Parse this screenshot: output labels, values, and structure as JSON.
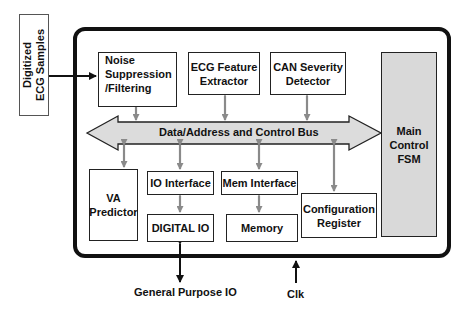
{
  "diagram": {
    "type": "block-diagram",
    "input": {
      "label_line1": "Digitized",
      "label_line2": "ECG Samples"
    },
    "blocks": {
      "noise": {
        "line1": "Noise",
        "line2": "Suppression",
        "line3": "/Filtering"
      },
      "feature": {
        "line1": "ECG Feature",
        "line2": "Extractor"
      },
      "can": {
        "line1": "CAN Severity",
        "line2": "Detector"
      },
      "fsm": {
        "line1": "Main",
        "line2": "Control",
        "line3": "FSM"
      },
      "va": {
        "line1": "VA",
        "line2": "Predictor"
      },
      "io_interface": {
        "label": "IO Interface"
      },
      "mem_interface": {
        "label": "Mem Interface"
      },
      "digital_io": {
        "label": "DIGITAL IO"
      },
      "memory": {
        "label": "Memory"
      },
      "config": {
        "line1": "Configuration",
        "line2": "Register"
      }
    },
    "bus": {
      "label": "Data/Address and Control Bus"
    },
    "external": {
      "gpio": "General Purpose IO",
      "clk": "Clk"
    },
    "colors": {
      "line": "#111111",
      "bus_fill": "#dcdcdc",
      "connector": "#8a8a8a",
      "fsm_fill": "#d9d9d9"
    }
  }
}
